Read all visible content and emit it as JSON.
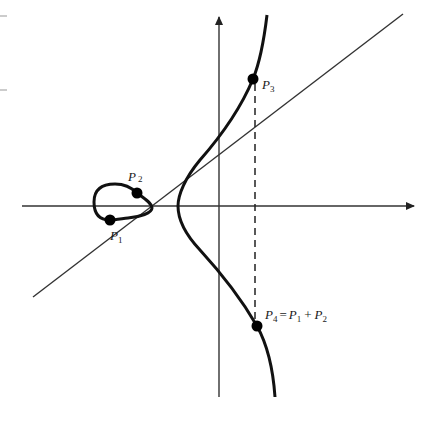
{
  "figure": {
    "colors": {
      "curve": "#111111",
      "axis": "#333333",
      "line": "#333333",
      "point": "#000000",
      "background": "#ffffff"
    },
    "axes": {
      "x_axis": {
        "y": 206,
        "x_start": 22,
        "x_end": 415,
        "arrow": true
      },
      "y_axis": {
        "x": 219,
        "y_start": 397,
        "y_end": 15,
        "arrow": true
      }
    },
    "curve": {
      "egg_component": "closed loop left of y-axis",
      "infinite_component": "right branch, vertex at x-axis"
    },
    "secant_line": {
      "from": [
        33,
        297
      ],
      "to": [
        403,
        14
      ]
    },
    "dashed_reflection": {
      "x": 255,
      "from_y": 80,
      "to_y": 326
    },
    "points": [
      {
        "id": "P1",
        "letter": "P",
        "subscript": "1",
        "x": 110,
        "y": 220
      },
      {
        "id": "P2",
        "letter": "P",
        "subscript": "2",
        "x": 137,
        "y": 193
      },
      {
        "id": "P3",
        "letter": "P",
        "subscript": "3",
        "x": 253,
        "y": 79
      },
      {
        "id": "P4",
        "letter": "P",
        "subscript": "4",
        "x": 257,
        "y": 326
      }
    ],
    "labels": {
      "p1": {
        "letter": "P",
        "sub": "1"
      },
      "p2": {
        "letter": "P",
        "sub": "2"
      },
      "p3": {
        "letter": "P",
        "sub": "3"
      },
      "p4": {
        "letter": "P",
        "sub": "4",
        "equals": "=",
        "rhs1_letter": "P",
        "rhs1_sub": "1",
        "plus": "+",
        "rhs2_letter": "P",
        "rhs2_sub": "2"
      }
    }
  }
}
